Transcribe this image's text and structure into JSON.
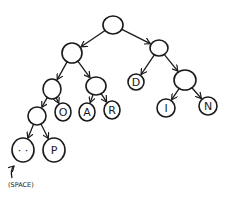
{
  "diagram": {
    "type": "binary-tree",
    "stroke_color": "#1a1a1a",
    "background": "#ffffff",
    "nodes": [
      {
        "id": "root",
        "label": "",
        "x": 113,
        "y": 25,
        "rx": 10,
        "ry": 9
      },
      {
        "id": "n1",
        "label": "",
        "x": 72,
        "y": 53,
        "rx": 10,
        "ry": 10
      },
      {
        "id": "n2",
        "label": "",
        "x": 159,
        "y": 48,
        "rx": 9,
        "ry": 8
      },
      {
        "id": "n3",
        "label": "",
        "x": 52,
        "y": 89,
        "rx": 9,
        "ry": 10
      },
      {
        "id": "n4",
        "label": "",
        "x": 96,
        "y": 86,
        "rx": 10,
        "ry": 9
      },
      {
        "id": "d",
        "label": "D",
        "x": 136,
        "y": 82,
        "rx": 8,
        "ry": 8
      },
      {
        "id": "n5",
        "label": "",
        "x": 185,
        "y": 80,
        "rx": 11,
        "ry": 10
      },
      {
        "id": "n6",
        "label": "",
        "x": 37,
        "y": 116,
        "rx": 9,
        "ry": 9
      },
      {
        "id": "o",
        "label": "O",
        "x": 63,
        "y": 112,
        "rx": 8,
        "ry": 9
      },
      {
        "id": "a",
        "label": "A",
        "x": 87,
        "y": 112,
        "rx": 8,
        "ry": 9
      },
      {
        "id": "r",
        "label": "R",
        "x": 112,
        "y": 110,
        "rx": 8,
        "ry": 9
      },
      {
        "id": "i",
        "label": "I",
        "x": 166,
        "y": 108,
        "rx": 9,
        "ry": 9
      },
      {
        "id": "nn",
        "label": "N",
        "x": 208,
        "y": 106,
        "rx": 9,
        "ry": 9
      },
      {
        "id": "space",
        "label": "·  ·",
        "x": 23,
        "y": 150,
        "rx": 11,
        "ry": 12
      },
      {
        "id": "p",
        "label": "P",
        "x": 54,
        "y": 150,
        "rx": 11,
        "ry": 12
      }
    ],
    "edges": [
      {
        "from": "root",
        "to": "n1"
      },
      {
        "from": "root",
        "to": "n2"
      },
      {
        "from": "n1",
        "to": "n3"
      },
      {
        "from": "n1",
        "to": "n4"
      },
      {
        "from": "n2",
        "to": "d"
      },
      {
        "from": "n2",
        "to": "n5"
      },
      {
        "from": "n3",
        "to": "n6"
      },
      {
        "from": "n3",
        "to": "o"
      },
      {
        "from": "n4",
        "to": "a"
      },
      {
        "from": "n4",
        "to": "r"
      },
      {
        "from": "n5",
        "to": "i"
      },
      {
        "from": "n5",
        "to": "nn"
      },
      {
        "from": "n6",
        "to": "space"
      },
      {
        "from": "n6",
        "to": "p"
      }
    ],
    "annotation": {
      "text": "(SPACE)",
      "x": 8,
      "y": 185,
      "points_to": "space"
    }
  }
}
